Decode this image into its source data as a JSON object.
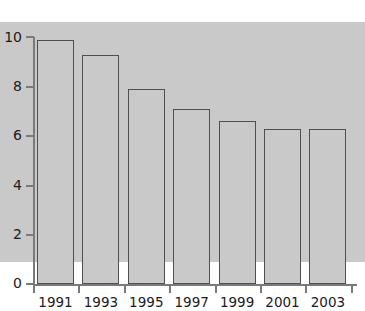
{
  "chart_data": {
    "type": "bar",
    "title": "",
    "subtitle": "",
    "xlabel": "",
    "ylabel": "",
    "categories": [
      "1991",
      "1993",
      "1995",
      "1997",
      "1999",
      "2001",
      "2003"
    ],
    "values": [
      9.7,
      9.9,
      9.3,
      7.9,
      7.1,
      6.6,
      6.3
    ],
    "series": [
      {
        "name": "",
        "values": [
          9.7,
          9.9,
          9.3,
          7.9,
          7.1,
          6.6,
          6.3
        ]
      }
    ],
    "ylim": [
      0,
      10
    ],
    "y_ticks": [
      0,
      2,
      4,
      6,
      8,
      10
    ],
    "y_tick_labels": [
      "0",
      "2",
      "4",
      "6",
      "8",
      "10"
    ],
    "x_tick_labels": [
      "1991",
      "1993",
      "1995",
      "1997",
      "1999",
      "2001",
      "2003"
    ],
    "grid": false,
    "legend": false,
    "legend_position": "none",
    "bar_fill_color": "#c9c9c9",
    "bar_edge_color": "#4f4f4f",
    "axis_color": "#7a7a7a",
    "text_color": "#1b1b1b",
    "background_color": "#ffffff"
  }
}
